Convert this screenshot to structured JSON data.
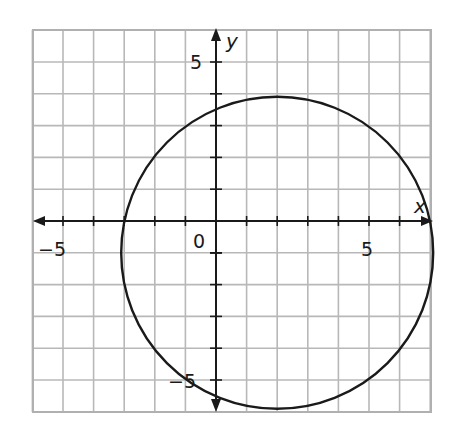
{
  "chart_data": {
    "type": "line",
    "title": "",
    "xlabel": "x",
    "ylabel": "y",
    "xlim": [
      -6,
      7
    ],
    "ylim": [
      -6,
      6
    ],
    "grid": true,
    "grid_step": 1,
    "tick_labels": {
      "x": [
        {
          "value": -5,
          "label": "−5"
        },
        {
          "value": 5,
          "label": "5"
        }
      ],
      "y": [
        {
          "value": 5,
          "label": "5"
        },
        {
          "value": -5,
          "label": "−5"
        }
      ],
      "origin": "0"
    },
    "series": [
      {
        "name": "circle",
        "shape": "circle",
        "center": [
          2,
          -1
        ],
        "radius": 5,
        "equation": "(x-2)^2 + (y+1)^2 = 25"
      }
    ]
  },
  "labels": {
    "x_axis": "x",
    "y_axis": "y",
    "origin": "0",
    "x_neg5": "−5",
    "x_pos5": "5",
    "y_pos5": "5",
    "y_neg5": "−5"
  },
  "colors": {
    "grid": "#b8b8b8",
    "axis": "#1a1a1a",
    "curve": "#1a1a1a",
    "background": "#ffffff"
  }
}
